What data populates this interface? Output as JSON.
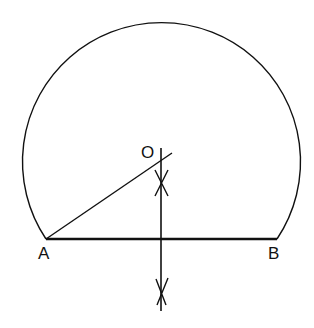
{
  "diagram": {
    "labels": {
      "A": "A",
      "B": "B",
      "O": "O"
    },
    "points": {
      "A": [
        46,
        239
      ],
      "B": [
        277,
        239
      ],
      "O": [
        161,
        162
      ]
    },
    "stroke_color": "#111111",
    "background": "#ffffff"
  }
}
